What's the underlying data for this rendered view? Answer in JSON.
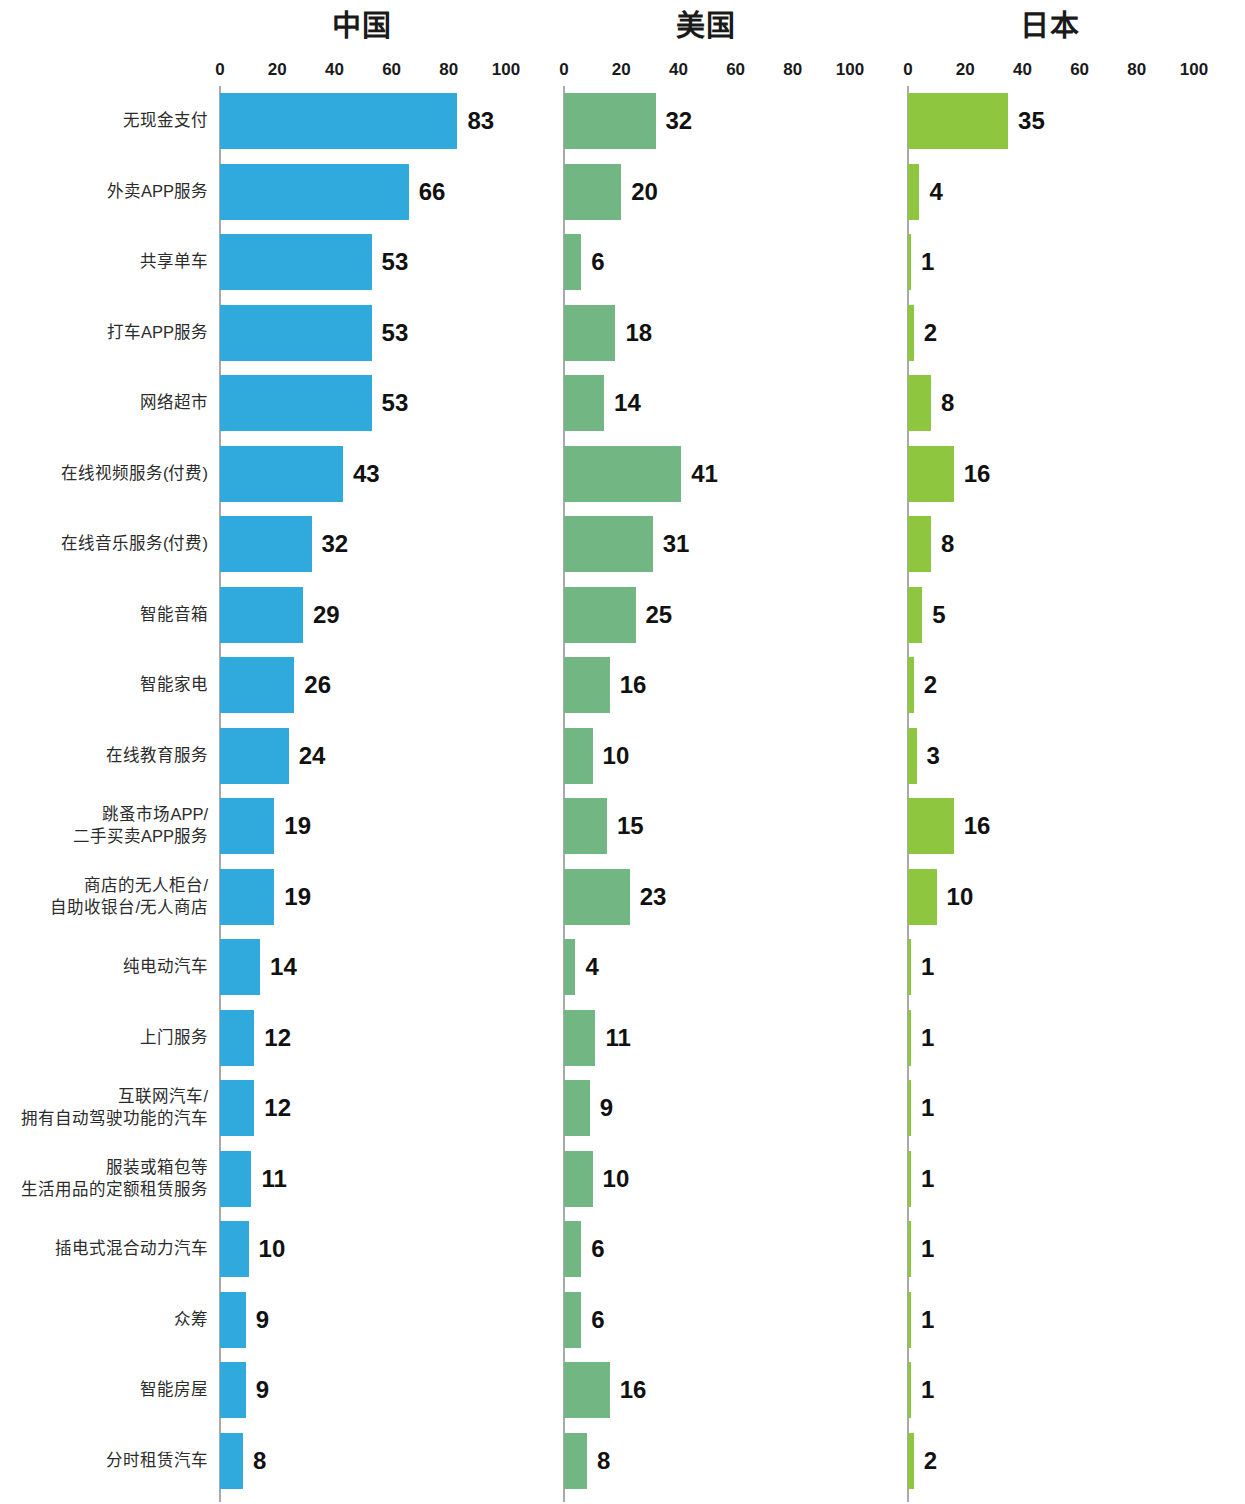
{
  "chart_data": {
    "type": "bar",
    "title": "",
    "orientation": "horizontal",
    "grid": false,
    "legend_position": "none",
    "xlabel": "",
    "ylabel": "",
    "xlim": [
      0,
      100
    ],
    "xticks": [
      "0",
      "20",
      "40",
      "60",
      "80",
      "100"
    ],
    "categories": [
      "无现金支付",
      "外卖APP服务",
      "共享单车",
      "打车APP服务",
      "网络超市",
      "在线视频服务(付费)",
      "在线音乐服务(付费)",
      "智能音箱",
      "智能家电",
      "在线教育服务",
      "跳蚤市场APP/\n二手买卖APP服务",
      "商店的无人柜台/\n自助收银台/无人商店",
      "纯电动汽车",
      "上门服务",
      "互联网汽车/\n拥有自动驾驶功能的汽车",
      "服装或箱包等\n生活用品的定额租赁服务",
      "插电式混合动力汽车",
      "众筹",
      "智能房屋",
      "分时租赁汽车"
    ],
    "series": [
      {
        "name": "中国",
        "color": "#30a9dd",
        "values": [
          83,
          66,
          53,
          53,
          53,
          43,
          32,
          29,
          26,
          24,
          19,
          19,
          14,
          12,
          12,
          11,
          10,
          9,
          9,
          8
        ]
      },
      {
        "name": "美国",
        "color": "#72b683",
        "values": [
          32,
          20,
          6,
          18,
          14,
          41,
          31,
          25,
          16,
          10,
          15,
          23,
          4,
          11,
          9,
          10,
          6,
          6,
          16,
          8
        ]
      },
      {
        "name": "日本",
        "color": "#8ec63f",
        "values": [
          35,
          4,
          1,
          2,
          8,
          16,
          8,
          5,
          2,
          3,
          16,
          10,
          1,
          1,
          1,
          1,
          1,
          1,
          1,
          2
        ]
      }
    ]
  }
}
